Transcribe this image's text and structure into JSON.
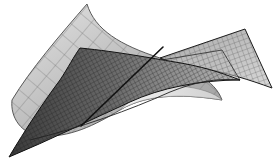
{
  "figure": {
    "width": 277,
    "height": 164,
    "background": "#ffffff"
  },
  "surfaces": [
    {
      "name": "light-curved-surface",
      "fill": "#c9c9c9",
      "fill_light": "#e8e8e8",
      "stroke": "#555555",
      "grid": "coarse"
    },
    {
      "name": "dark-grid-surface",
      "fill": "#5a5a5a",
      "fill_light": "#bdbdbd",
      "stroke": "#1a1a1a",
      "grid": "fine"
    }
  ],
  "line": {
    "name": "intersecting-line",
    "color": "#111111",
    "from": [
      81,
      126
    ],
    "to": [
      163,
      47
    ]
  }
}
